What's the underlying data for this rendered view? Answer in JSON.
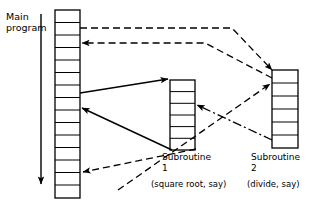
{
  "diagram": {
    "stroke_color": "#000000",
    "background_color": "#ffffff"
  },
  "main_program": {
    "label": "Main\nprogram",
    "cell_count": 15,
    "flow_arrow": "downward-execution-arrow"
  },
  "subroutine_1": {
    "name": "Subroutine\n1",
    "description": "(square root, say)",
    "cell_count": 6
  },
  "subroutine_2": {
    "name": "Subroutine\n2",
    "description": "(divide, say)",
    "cell_count": 6
  },
  "connectors": [
    {
      "id": "call-sub2-upper",
      "style": "dashed",
      "from": "main-program",
      "to": "subroutine-2",
      "arrowhead": "at-target"
    },
    {
      "id": "return-sub2-to-main",
      "style": "dashed",
      "from": "subroutine-2",
      "to": "main-program",
      "arrowhead": "at-target"
    },
    {
      "id": "call-sub1-upper",
      "style": "solid",
      "from": "main-program",
      "to": "subroutine-1",
      "arrowhead": "at-target"
    },
    {
      "id": "return-sub1-to-main",
      "style": "solid",
      "from": "subroutine-1",
      "to": "main-program",
      "arrowhead": "at-target"
    },
    {
      "id": "call-sub2-lower",
      "style": "dashed",
      "from": "main-program",
      "to": "subroutine-2",
      "arrowhead": "at-target"
    },
    {
      "id": "return-sub2-lower-to-main",
      "style": "dashed",
      "from": "subroutine-2",
      "to": "main-program",
      "arrowhead": "at-target"
    },
    {
      "id": "sub2-to-sub1",
      "style": "dash-dot",
      "from": "subroutine-2",
      "to": "subroutine-1",
      "arrowhead": "at-target"
    }
  ]
}
